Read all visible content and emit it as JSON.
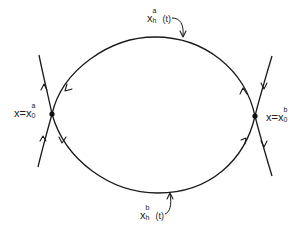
{
  "diagram": {
    "type": "phase-portrait-heteroclinic-cycle",
    "stroke_color": "#1a1a1a",
    "background": "#ffffff",
    "saddle_points": [
      {
        "id": "left",
        "label_lhs": "x",
        "label_eq": "=",
        "label_base": "x",
        "label_sup": "a",
        "label_sub": "0",
        "position": [
          52,
          114
        ]
      },
      {
        "id": "right",
        "label_lhs": "x",
        "label_eq": "=",
        "label_base": "x",
        "label_sup": "b",
        "label_sub": "0",
        "position": [
          255,
          116
        ]
      }
    ],
    "orbits": [
      {
        "id": "upper",
        "label_base": "x",
        "label_sup": "a",
        "label_sub": "h",
        "label_arg": "(t)"
      },
      {
        "id": "lower",
        "label_base": "x",
        "label_sup": "b",
        "label_sub": "h",
        "label_arg": "(t)"
      }
    ]
  }
}
